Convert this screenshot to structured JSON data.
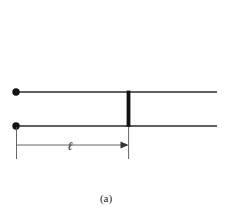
{
  "figure": {
    "caption": "(a)",
    "background_color": "#ffffff",
    "line_color": "#2b2b2b",
    "thin_line_color": "#4a4a4a",
    "bar_color": "#111111",
    "width": 231,
    "height": 218
  },
  "diagram": {
    "type": "transmission-line-short-circuited-stub",
    "conductors": [
      {
        "name": "upper-conductor",
        "x1": 16,
        "y1": 92,
        "x2": 217,
        "y2": 92,
        "stroke_width": 1.6
      },
      {
        "name": "lower-conductor",
        "x1": 16,
        "y1": 126,
        "x2": 217,
        "y2": 126,
        "stroke_width": 1.6
      }
    ],
    "terminals": [
      {
        "name": "upper-terminal-dot",
        "cx": 16,
        "cy": 92,
        "r": 3.6
      },
      {
        "name": "lower-terminal-dot",
        "cx": 16,
        "cy": 126,
        "r": 3.6
      }
    ],
    "shorting_bar": {
      "name": "shorting-bar",
      "x": 126.6,
      "y": 91,
      "width": 3.6,
      "height": 36
    },
    "dimension": {
      "label": "ℓ",
      "label_x": 70,
      "label_y": 150,
      "line_y": 145,
      "x_start": 16,
      "x_end": 128.4,
      "extension_top_left_y": 126,
      "extension_top_right_y": 126,
      "extension_bottom_y": 159,
      "arrow_direction": "right",
      "arrow_size": 6
    }
  }
}
